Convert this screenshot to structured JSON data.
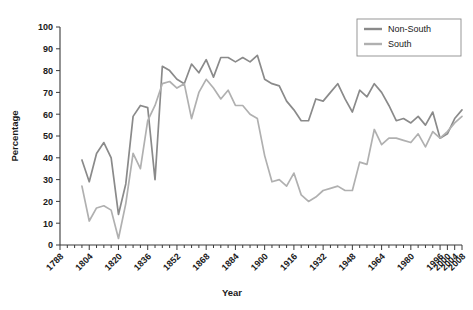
{
  "chart_data": {
    "type": "line",
    "title": "",
    "xlabel": "Year",
    "ylabel": "Percentage",
    "ylim": [
      0,
      100
    ],
    "xlim": [
      1788,
      2008
    ],
    "grid": false,
    "legend_position": "top-right",
    "ytick_labels": [
      "0",
      "10",
      "20",
      "30",
      "40",
      "50",
      "60",
      "70",
      "80",
      "90",
      "100"
    ],
    "ytick_values": [
      0,
      10,
      20,
      30,
      40,
      50,
      60,
      70,
      80,
      90,
      100
    ],
    "xtick_labels": [
      "1788",
      "1804",
      "1820",
      "1836",
      "1852",
      "1868",
      "1884",
      "1900",
      "1916",
      "1932",
      "1948",
      "1964",
      "1980",
      "1996",
      "2000",
      "2004",
      "2008"
    ],
    "xtick_values": [
      1788,
      1804,
      1820,
      1836,
      1852,
      1868,
      1884,
      1900,
      1916,
      1932,
      1948,
      1964,
      1980,
      1996,
      2000,
      2004,
      2008
    ],
    "x": [
      1788,
      1792,
      1796,
      1800,
      1804,
      1808,
      1812,
      1816,
      1820,
      1824,
      1828,
      1832,
      1836,
      1840,
      1844,
      1848,
      1852,
      1856,
      1860,
      1864,
      1868,
      1872,
      1876,
      1880,
      1884,
      1888,
      1892,
      1896,
      1900,
      1904,
      1908,
      1912,
      1916,
      1920,
      1924,
      1928,
      1932,
      1936,
      1940,
      1944,
      1948,
      1952,
      1956,
      1960,
      1964,
      1968,
      1972,
      1976,
      1980,
      1984,
      1988,
      1992,
      1996,
      2000,
      2004,
      2008
    ],
    "series": [
      {
        "name": "Non-South",
        "color": "#8a8a8a",
        "values": [
          null,
          null,
          null,
          39,
          29,
          42,
          47,
          40,
          14,
          28,
          59,
          64,
          63,
          30,
          82,
          80,
          76,
          74,
          83,
          79,
          85,
          77,
          86,
          86,
          84,
          86,
          84,
          87,
          76,
          74,
          73,
          66,
          62,
          57,
          57,
          67,
          66,
          70,
          74,
          67,
          61,
          71,
          68,
          74,
          70,
          64,
          57,
          58,
          56,
          59,
          55,
          61,
          49,
          51,
          58,
          62
        ]
      },
      {
        "name": "South",
        "color": "#b0b0b0",
        "values": [
          null,
          null,
          null,
          27,
          11,
          17,
          18,
          16,
          3,
          19,
          42,
          35,
          57,
          64,
          74,
          75,
          72,
          74,
          58,
          70,
          76,
          72,
          67,
          71,
          64,
          64,
          60,
          58,
          41,
          29,
          30,
          27,
          33,
          23,
          20,
          22,
          25,
          26,
          27,
          25,
          25,
          38,
          37,
          53,
          46,
          49,
          49,
          48,
          47,
          51,
          45,
          52,
          49,
          52,
          56,
          59
        ]
      }
    ]
  },
  "legend": {
    "items": [
      {
        "label": "Non-South"
      },
      {
        "label": "South"
      }
    ]
  }
}
